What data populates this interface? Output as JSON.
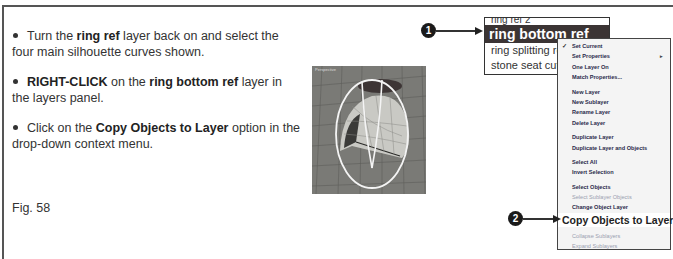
{
  "instructions": {
    "steps": [
      {
        "parts": [
          {
            "text": "Turn the ",
            "bold": false
          },
          {
            "text": "ring ref",
            "bold": true
          },
          {
            "text": " layer back on and select the four main silhouette curves shown.",
            "bold": false
          }
        ]
      },
      {
        "parts": [
          {
            "text": "RIGHT-CLICK",
            "bold": true
          },
          {
            "text": " on the ",
            "bold": false
          },
          {
            "text": "ring bottom ref",
            "bold": true
          },
          {
            "text": " layer in the layers panel.",
            "bold": false
          }
        ]
      },
      {
        "parts": [
          {
            "text": "Click on the ",
            "bold": false
          },
          {
            "text": "Copy Objects to Layer",
            "bold": true
          },
          {
            "text": " option in the drop-down context menu.",
            "bold": false
          }
        ]
      }
    ],
    "figure_label": "Fig. 58"
  },
  "viewport": {
    "label": "Perspective"
  },
  "layers_panel": {
    "rows": [
      {
        "name": "ring ref 2",
        "state": "partial"
      },
      {
        "name": "ring bottom ref",
        "state": "selected"
      },
      {
        "name": "ring splitting ref",
        "state": "normal"
      },
      {
        "name": "stone seat cutter",
        "state": "normal"
      }
    ]
  },
  "callouts": {
    "one": "1",
    "two": "2"
  },
  "context_menu": {
    "groups": [
      [
        {
          "label": "Set Current",
          "checked": true
        },
        {
          "label": "Set Properties",
          "submenu": true
        },
        {
          "label": "One Layer On"
        },
        {
          "label": "Match Properties..."
        }
      ],
      [
        {
          "label": "New Layer"
        },
        {
          "label": "New Sublayer"
        },
        {
          "label": "Rename Layer"
        },
        {
          "label": "Delete Layer"
        }
      ],
      [
        {
          "label": "Duplicate Layer"
        },
        {
          "label": "Duplicate Layer and Objects"
        }
      ],
      [
        {
          "label": "Select All"
        },
        {
          "label": "Invert Selection"
        }
      ],
      [
        {
          "label": "Select Objects"
        },
        {
          "label": "Select Sublayer Objects",
          "disabled": true
        },
        {
          "label": "Change Object Layer"
        },
        {
          "label": "Copy Objects to Layer",
          "highlight": true
        }
      ],
      [
        {
          "label": "Collapse Sublayers",
          "disabled": true
        },
        {
          "label": "Expand Sublayers",
          "disabled": true
        }
      ]
    ]
  },
  "colors": {
    "selected_layer_bg": "#3b3434",
    "viewport_bg": "#7a7a76",
    "menu_bg": "#f4f4f4",
    "callout_bg": "#1a1a1a"
  }
}
